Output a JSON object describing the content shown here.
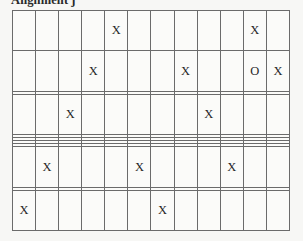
{
  "caption": {
    "text": "Alignment j"
  },
  "colors": {
    "background": "#f7f7f5",
    "cell_fill": "#fbfbf9",
    "grid_line": "#6b6b6b",
    "glyph": "#262626"
  },
  "grid": {
    "columns": 12,
    "rows": 11,
    "mark_x": "X",
    "mark_o": "O",
    "empty": "",
    "cells": [
      [
        "",
        "",
        "",
        "",
        "X",
        "",
        "",
        "",
        "",
        "",
        "X",
        ""
      ],
      [
        "",
        "",
        "",
        "X",
        "",
        "",
        "",
        "X",
        "",
        "",
        "O",
        "X"
      ],
      [
        "",
        "",
        "",
        "",
        "",
        "",
        "",
        "",
        "",
        "",
        "",
        ""
      ],
      [
        "",
        "",
        "X",
        "",
        "",
        "",
        "",
        "",
        "X",
        "",
        "",
        ""
      ],
      [
        "",
        "",
        "",
        "",
        "",
        "",
        "",
        "",
        "",
        "",
        "",
        ""
      ],
      [
        "",
        "",
        "",
        "",
        "",
        "",
        "",
        "",
        "",
        "",
        "",
        ""
      ],
      [
        "",
        "",
        "",
        "",
        "",
        "",
        "",
        "",
        "",
        "",
        "",
        ""
      ],
      [
        "",
        "",
        "",
        "",
        "",
        "",
        "",
        "",
        "",
        "",
        "",
        ""
      ],
      [
        "",
        "X",
        "",
        "",
        "",
        "X",
        "",
        "",
        "",
        "X",
        "",
        ""
      ],
      [
        "",
        "",
        "",
        "",
        "",
        "",
        "",
        "",
        "",
        "",
        "",
        ""
      ],
      [
        "X",
        "",
        "",
        "",
        "",
        "",
        "X",
        "",
        "",
        "",
        "",
        ""
      ]
    ]
  }
}
